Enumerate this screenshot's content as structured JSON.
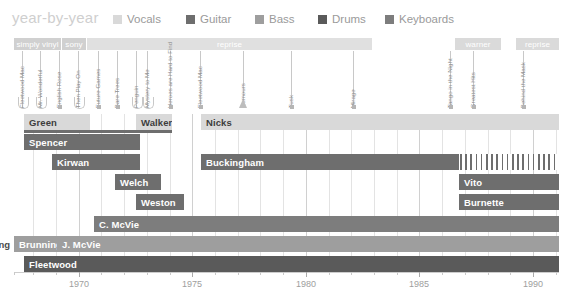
{
  "header": {
    "title": "year-by-year",
    "legend": [
      {
        "label": "Vocals",
        "color": "#d9d9d9",
        "x": 113
      },
      {
        "label": "Guitar",
        "color": "#6e6e6e",
        "x": 186
      },
      {
        "label": "Bass",
        "color": "#9e9e9e",
        "x": 255
      },
      {
        "label": "Drums",
        "color": "#5a5a5a",
        "x": 318
      },
      {
        "label": "Keyboards",
        "color": "#7d7d7d",
        "x": 385
      }
    ]
  },
  "labels_band": [
    {
      "name": "simply vinyl",
      "x": 14,
      "w": 47,
      "color": "#d0d0d0",
      "align": "center"
    },
    {
      "name": "sony",
      "x": 62,
      "w": 24,
      "color": "#d0d0d0",
      "align": "center"
    },
    {
      "name": "reprise",
      "x": 87,
      "w": 285,
      "color": "#e0e0e0",
      "align": "center"
    },
    {
      "name": "warner",
      "x": 455,
      "w": 46,
      "color": "#dadada",
      "align": "center"
    },
    {
      "name": "reprise",
      "x": 516,
      "w": 43,
      "color": "#dadada",
      "align": "center"
    }
  ],
  "albums": [
    {
      "title": "Fleetwood Mac",
      "x": 22,
      "marker": "cap"
    },
    {
      "title": "Mr. Wonderful",
      "x": 40,
      "marker": "cap"
    },
    {
      "title": "English Rose",
      "x": 59,
      "marker": "dot"
    },
    {
      "title": "Then Play On",
      "x": 78,
      "marker": "cap"
    },
    {
      "title": "Future Games",
      "x": 98,
      "marker": "dot"
    },
    {
      "title": "Bare Trees",
      "x": 117,
      "marker": "dot"
    },
    {
      "title": "Penguin",
      "x": 136,
      "marker": "cap"
    },
    {
      "title": "Mystery to Me",
      "x": 147,
      "marker": "cap"
    },
    {
      "title": "Heroes are Hard to Find",
      "x": 170,
      "marker": "dot"
    },
    {
      "title": "Fleetwood Mac",
      "x": 200,
      "marker": "dot"
    },
    {
      "title": "Rumours",
      "x": 243,
      "marker": "tri"
    },
    {
      "title": "Tusk",
      "x": 291,
      "marker": "dot"
    },
    {
      "title": "Mirage",
      "x": 353,
      "marker": "dot"
    },
    {
      "title": "Tango in the Night",
      "x": 450,
      "marker": "dot"
    },
    {
      "title": "Greatest Hits",
      "x": 473,
      "marker": "dot"
    },
    {
      "title": "Behind the Mask",
      "x": 523,
      "marker": "dot"
    }
  ],
  "chart_data": {
    "type": "bar",
    "title": "year-by-year",
    "xlabel": "",
    "ylabel": "",
    "xlim": [
      1967.0,
      1991.5
    ],
    "tick_labels": [
      "1970",
      "1975",
      "1980",
      "1985",
      "1990"
    ],
    "tick_values": [
      1970,
      1975,
      1980,
      1985,
      1990
    ],
    "grid": true,
    "legend_position": "top",
    "categories": [
      "Green",
      "Spencer",
      "Kirwan",
      "Welch",
      "Weston",
      "C. McVie",
      "J. McVie",
      "Fleetwood",
      "Walker",
      "Nicks",
      "Buckingham",
      "Vito",
      "Burnette",
      "Brunning"
    ],
    "series": [
      {
        "name": "Vocals",
        "color": "#d9d9d9"
      },
      {
        "name": "Guitar",
        "color": "#6e6e6e"
      },
      {
        "name": "Bass",
        "color": "#9e9e9e"
      },
      {
        "name": "Drums",
        "color": "#5a5a5a"
      },
      {
        "name": "Keyboards",
        "color": "#7d7d7d"
      }
    ],
    "bars": [
      {
        "label": "Green",
        "row": 0,
        "x": 24,
        "w": 66,
        "role": "Vocals",
        "color": "#d9d9d9",
        "text_color": "dark",
        "underline": {
          "x": 24,
          "w": 137,
          "color": "#6e6e6e"
        }
      },
      {
        "label": "Walker",
        "row": 0,
        "x": 136,
        "w": 36,
        "role": "Vocals",
        "color": "#d9d9d9",
        "text_color": "dark",
        "underline": {
          "x": 136,
          "w": 36,
          "color": "#6e6e6e"
        }
      },
      {
        "label": "Nicks",
        "row": 0,
        "x": 201,
        "w": 358,
        "role": "Vocals",
        "color": "#d9d9d9",
        "text_color": "dark"
      },
      {
        "label": "Spencer",
        "row": 1,
        "x": 24,
        "w": 116,
        "role": "Guitar",
        "color": "#6e6e6e"
      },
      {
        "label": "Kirwan",
        "row": 2,
        "x": 52,
        "w": 88,
        "role": "Guitar",
        "color": "#6e6e6e"
      },
      {
        "label": "Buckingham",
        "row": 2,
        "x": 201,
        "w": 258,
        "role": "Guitar",
        "color": "#6e6e6e"
      },
      {
        "label": "",
        "row": 2,
        "x": 460,
        "w": 99,
        "role": "Guitar",
        "color": "#6e6e6e",
        "hatch": true
      },
      {
        "label": "Welch",
        "row": 3,
        "x": 115,
        "w": 46,
        "role": "Guitar",
        "color": "#6e6e6e"
      },
      {
        "label": "Vito",
        "row": 3,
        "x": 459,
        "w": 100,
        "role": "Guitar",
        "color": "#6e6e6e"
      },
      {
        "label": "Weston",
        "row": 4,
        "x": 136,
        "w": 48,
        "role": "Guitar",
        "color": "#6e6e6e"
      },
      {
        "label": "Burnette",
        "row": 4,
        "x": 459,
        "w": 100,
        "role": "Guitar",
        "color": "#6e6e6e"
      },
      {
        "label": "C. McVie",
        "row": 5,
        "x": 94,
        "w": 465,
        "role": "Keyboards",
        "color": "#7d7d7d"
      },
      {
        "label": "Brunning",
        "row": 6,
        "x": 14,
        "w": 43,
        "role": "Bass",
        "color": "#9e9e9e",
        "outside_label": "Brunning"
      },
      {
        "label": "J. McVie",
        "row": 6,
        "x": 57,
        "w": 502,
        "role": "Bass",
        "color": "#9e9e9e"
      },
      {
        "label": "Fleetwood",
        "row": 7,
        "x": 24,
        "w": 535,
        "role": "Drums",
        "color": "#5a5a5a"
      }
    ],
    "row_tops": [
      0,
      20,
      40,
      60,
      80,
      102,
      122,
      142
    ],
    "gridlines": [
      {
        "year": 1968,
        "x": 33,
        "major": false
      },
      {
        "year": 1969,
        "x": 56,
        "major": false
      },
      {
        "year": 1970,
        "x": 79,
        "major": true
      },
      {
        "year": 1971,
        "x": 101,
        "major": false
      },
      {
        "year": 1972,
        "x": 124,
        "major": false
      },
      {
        "year": 1973,
        "x": 147,
        "major": false
      },
      {
        "year": 1974,
        "x": 170,
        "major": false
      },
      {
        "year": 1975,
        "x": 192,
        "major": true
      },
      {
        "year": 1976,
        "x": 215,
        "major": false
      },
      {
        "year": 1977,
        "x": 238,
        "major": false
      },
      {
        "year": 1978,
        "x": 260,
        "major": false
      },
      {
        "year": 1979,
        "x": 283,
        "major": false
      },
      {
        "year": 1980,
        "x": 306,
        "major": true
      },
      {
        "year": 1981,
        "x": 329,
        "major": false
      },
      {
        "year": 1982,
        "x": 351,
        "major": false
      },
      {
        "year": 1983,
        "x": 374,
        "major": false
      },
      {
        "year": 1984,
        "x": 397,
        "major": false
      },
      {
        "year": 1985,
        "x": 419,
        "major": true
      },
      {
        "year": 1986,
        "x": 442,
        "major": false
      },
      {
        "year": 1987,
        "x": 465,
        "major": false
      },
      {
        "year": 1988,
        "x": 488,
        "major": false
      },
      {
        "year": 1989,
        "x": 510,
        "major": false
      },
      {
        "year": 1990,
        "x": 533,
        "major": true
      },
      {
        "year": 1991,
        "x": 556,
        "major": false
      }
    ],
    "axis_ticks": [
      {
        "x": 14,
        "major": false
      },
      {
        "x": 33,
        "major": false
      },
      {
        "x": 56,
        "major": false
      },
      {
        "x": 79,
        "major": true,
        "label": "1970"
      },
      {
        "x": 101,
        "major": false
      },
      {
        "x": 124,
        "major": false
      },
      {
        "x": 147,
        "major": false
      },
      {
        "x": 170,
        "major": false
      },
      {
        "x": 192,
        "major": true,
        "label": "1975"
      },
      {
        "x": 215,
        "major": false
      },
      {
        "x": 238,
        "major": false
      },
      {
        "x": 260,
        "major": false
      },
      {
        "x": 283,
        "major": false
      },
      {
        "x": 306,
        "major": true,
        "label": "1980"
      },
      {
        "x": 329,
        "major": false
      },
      {
        "x": 351,
        "major": false
      },
      {
        "x": 374,
        "major": false
      },
      {
        "x": 397,
        "major": false
      },
      {
        "x": 419,
        "major": true,
        "label": "1985"
      },
      {
        "x": 442,
        "major": false
      },
      {
        "x": 465,
        "major": false
      },
      {
        "x": 488,
        "major": false
      },
      {
        "x": 510,
        "major": false
      },
      {
        "x": 533,
        "major": true,
        "label": "1990"
      },
      {
        "x": 556,
        "major": false
      }
    ]
  }
}
